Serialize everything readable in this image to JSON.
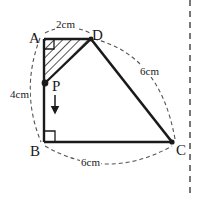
{
  "figure": {
    "type": "geometry-diagram",
    "shape": "right-trapezoid-ABCD",
    "vertices": [
      {
        "name": "A",
        "label": "A",
        "x": 44,
        "y": 39
      },
      {
        "name": "D",
        "label": "D",
        "x": 91,
        "y": 39
      },
      {
        "name": "B",
        "label": "B",
        "x": 44,
        "y": 142
      },
      {
        "name": "C",
        "label": "C",
        "x": 172,
        "y": 142
      }
    ],
    "moving_point": {
      "name": "P",
      "label": "P",
      "x": 45,
      "y": 83,
      "on_segment": "AB",
      "direction": "down"
    },
    "measurements": [
      {
        "name": "AD",
        "value": "2",
        "unit": "cm",
        "text": "2cm"
      },
      {
        "name": "AB",
        "value": "4",
        "unit": "cm",
        "text": "4cm"
      },
      {
        "name": "DC",
        "value": "6",
        "unit": "cm",
        "text": "6cm"
      },
      {
        "name": "BC",
        "value": "6",
        "unit": "cm",
        "text": "6cm"
      }
    ],
    "right_angles": [
      "A",
      "B"
    ],
    "shaded_region": "triangle-ADP",
    "colors": {
      "stroke": "#1a1a1a",
      "dashed": "#555555",
      "hatch": "#2a2a2a",
      "background": "#ffffff"
    }
  }
}
